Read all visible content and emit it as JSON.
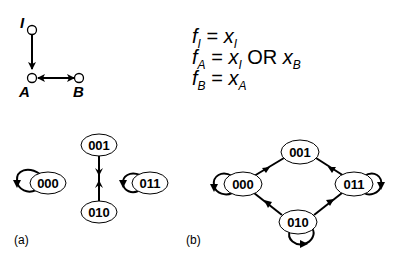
{
  "network": {
    "nodes": [
      {
        "id": "I",
        "label": "I"
      },
      {
        "id": "A",
        "label": "A"
      },
      {
        "id": "B",
        "label": "B"
      }
    ],
    "edges": [
      {
        "from": "I",
        "to": "A",
        "type": "directed"
      },
      {
        "from": "A",
        "to": "B",
        "type": "bidirectional"
      }
    ]
  },
  "equations": [
    {
      "lhs": "f",
      "lhs_sub": "I",
      "rhs": "x",
      "rhs_sub": "I",
      "op": "",
      "rhs2": "",
      "rhs2_sub": ""
    },
    {
      "lhs": "f",
      "lhs_sub": "A",
      "rhs": "x",
      "rhs_sub": "I",
      "op": "OR",
      "rhs2": "x",
      "rhs2_sub": "B"
    },
    {
      "lhs": "f",
      "lhs_sub": "B",
      "rhs": "x",
      "rhs_sub": "A",
      "op": "",
      "rhs2": "",
      "rhs2_sub": ""
    }
  ],
  "equals": "=",
  "panel_a": {
    "label": "(a)",
    "states": [
      "000",
      "001",
      "010",
      "011"
    ],
    "transitions": [
      {
        "from": "000",
        "to": "000"
      },
      {
        "from": "001",
        "to": "010"
      },
      {
        "from": "010",
        "to": "001"
      },
      {
        "from": "011",
        "to": "011"
      }
    ]
  },
  "panel_b": {
    "label": "(b)",
    "states": [
      "000",
      "001",
      "010",
      "011"
    ],
    "transitions": [
      {
        "from": "000",
        "to": "000"
      },
      {
        "from": "001",
        "to": "000"
      },
      {
        "from": "001",
        "to": "011"
      },
      {
        "from": "010",
        "to": "000"
      },
      {
        "from": "010",
        "to": "011"
      },
      {
        "from": "010",
        "to": "010"
      },
      {
        "from": "011",
        "to": "011"
      }
    ]
  }
}
